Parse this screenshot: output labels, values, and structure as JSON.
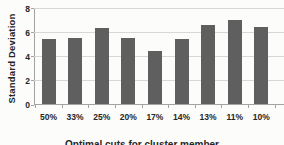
{
  "chart_data": {
    "type": "bar",
    "categories": [
      "50%",
      "33%",
      "25%",
      "20%",
      "17%",
      "14%",
      "13%",
      "11%",
      "10%"
    ],
    "values": [
      5.4,
      5.5,
      6.3,
      5.5,
      4.4,
      5.4,
      6.6,
      7.0,
      6.4
    ],
    "title": "",
    "xlabel": "Optimal cuts for cluster member",
    "xlabel_note": "partially cut off at bottom edge of screenshot",
    "ylabel": "Standard Deviation",
    "ylim": [
      0,
      8
    ],
    "yticks": [
      0,
      2,
      4,
      6,
      8
    ],
    "grid": true,
    "legend_position": "none",
    "bar_color": "#5f5f5f",
    "gridline_color": "#d7d7d5",
    "axis_color": "#a3a3a1",
    "text_color": "#262626",
    "background_color": "#fcfcfb"
  }
}
